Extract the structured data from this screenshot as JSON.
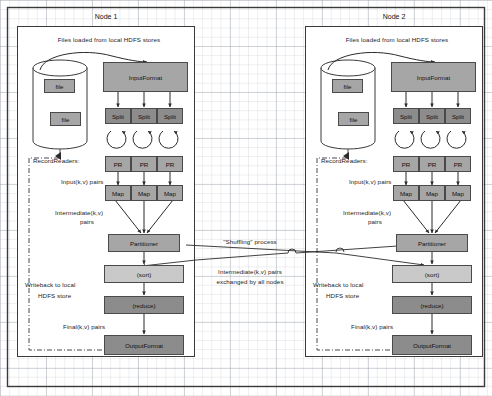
{
  "diagram": {
    "background": "graph-paper",
    "accent_fill_mid": "#a6a6a6",
    "accent_fill_dark": "#8c8c8c",
    "accent_fill_light": "#c9c9c9",
    "stroke": "#4a4a4a"
  },
  "nodes": [
    {
      "id": "node1",
      "title": "Node 1",
      "header_note": "Files loaded from local HDFS stores",
      "store": {
        "files": [
          "file",
          "file"
        ]
      },
      "blocks": {
        "input_format": "InputFormat",
        "splits": [
          "Split",
          "Split",
          "Split"
        ],
        "record_readers": [
          "PR",
          "PR",
          "PR"
        ],
        "maps": [
          "Map",
          "Map",
          "Map"
        ],
        "partitioner": "Partitioner",
        "sort": "(sort)",
        "reduce": "(reduce)",
        "output_format": "OutputFormat"
      },
      "labels": {
        "record_readers": "RecordReaders:",
        "input_pairs": "Input(k,v) pairs",
        "intermediate_pairs_l1": "Intermediate(k,v)",
        "intermediate_pairs_l2": "pairs",
        "writeback_l1": "Writeback to local",
        "writeback_l2": "HDFS store",
        "final_pairs": "Final(k,v) pairs"
      }
    },
    {
      "id": "node2",
      "title": "Node 2",
      "header_note": "Files loaded from local HDFS stores",
      "store": {
        "files": [
          "file",
          "file"
        ]
      },
      "blocks": {
        "input_format": "InputFormat",
        "splits": [
          "Split",
          "Split",
          "Split"
        ],
        "record_readers": [
          "PR",
          "PR",
          "PR"
        ],
        "maps": [
          "Map",
          "Map",
          "Map"
        ],
        "partitioner": "Partitioner",
        "sort": "(sort)",
        "reduce": "(reduce)",
        "output_format": "OutputFormat"
      },
      "labels": {
        "record_readers": "RecordReaders:",
        "input_pairs": "Input(k,v) pairs",
        "intermediate_pairs_l1": "Intermediate(k,v)",
        "intermediate_pairs_l2": "pairs",
        "writeback_l1": "Writeback to local",
        "writeback_l2": "HDFS store",
        "final_pairs": "Final(k,v) pairs"
      }
    }
  ],
  "shuffle": {
    "title": "\"Shuffling\" process",
    "caption_l1": "Intermediate(k,v) pairs",
    "caption_l2": "exchanged by all nodes"
  }
}
